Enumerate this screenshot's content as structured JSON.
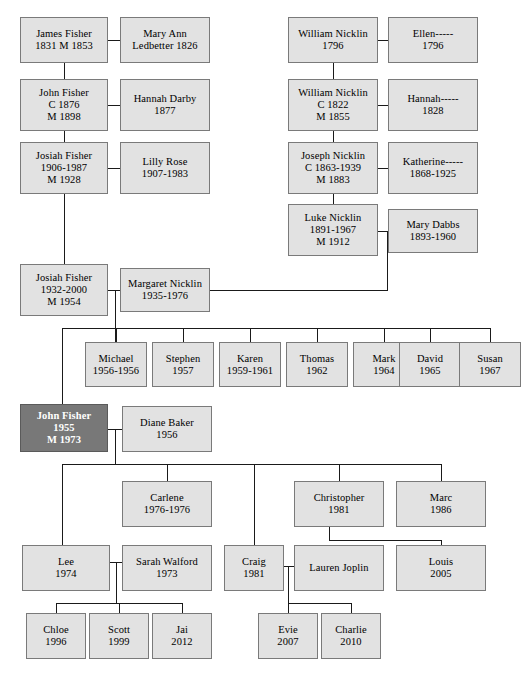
{
  "diagram": {
    "type": "genealogy-family-tree",
    "box_fill": "#e2e2e2",
    "box_border": "#7a7a7a",
    "highlight_fill": "#787878",
    "highlight_text": "#ffffff",
    "line_color": "#1a1a1a",
    "background": "#ffffff"
  },
  "nodes": [
    {
      "id": "james_fisher",
      "lines": [
        "James Fisher",
        "1831 M 1853"
      ],
      "x": 20,
      "y": 17,
      "w": 88,
      "h": 46,
      "highlight": false
    },
    {
      "id": "mary_ann",
      "lines": [
        "Mary Ann",
        "Ledbetter 1826"
      ],
      "x": 120,
      "y": 17,
      "w": 90,
      "h": 46,
      "highlight": false
    },
    {
      "id": "william_nicklin1",
      "lines": [
        "William Nicklin",
        "1796"
      ],
      "x": 288,
      "y": 17,
      "w": 90,
      "h": 46,
      "highlight": false
    },
    {
      "id": "ellen",
      "lines": [
        "Ellen-----",
        "1796"
      ],
      "x": 388,
      "y": 17,
      "w": 90,
      "h": 46,
      "highlight": false
    },
    {
      "id": "john_fisher1",
      "lines": [
        "John Fisher",
        "C 1876",
        "M 1898"
      ],
      "x": 20,
      "y": 79,
      "w": 88,
      "h": 52,
      "highlight": false
    },
    {
      "id": "hannah_darby",
      "lines": [
        "Hannah Darby",
        "1877"
      ],
      "x": 120,
      "y": 79,
      "w": 90,
      "h": 52,
      "highlight": false
    },
    {
      "id": "william_nicklin2",
      "lines": [
        "William Nicklin",
        "C 1822",
        "M 1855"
      ],
      "x": 288,
      "y": 79,
      "w": 90,
      "h": 52,
      "highlight": false
    },
    {
      "id": "hannah",
      "lines": [
        "Hannah-----",
        "1828"
      ],
      "x": 388,
      "y": 79,
      "w": 90,
      "h": 52,
      "highlight": false
    },
    {
      "id": "josiah_fisher1",
      "lines": [
        "Josiah Fisher",
        "1906-1987",
        "M 1928"
      ],
      "x": 20,
      "y": 142,
      "w": 88,
      "h": 52,
      "highlight": false
    },
    {
      "id": "lilly_rose",
      "lines": [
        "Lilly Rose",
        "1907-1983"
      ],
      "x": 120,
      "y": 142,
      "w": 90,
      "h": 52,
      "highlight": false
    },
    {
      "id": "joseph_nicklin",
      "lines": [
        "Joseph Nicklin",
        "C 1863-1939",
        "M 1883"
      ],
      "x": 288,
      "y": 142,
      "w": 90,
      "h": 52,
      "highlight": false
    },
    {
      "id": "katherine",
      "lines": [
        "Katherine-----",
        "1868-1925"
      ],
      "x": 388,
      "y": 142,
      "w": 90,
      "h": 52,
      "highlight": false
    },
    {
      "id": "luke_nicklin",
      "lines": [
        "Luke Nicklin",
        "1891-1967",
        "M 1912"
      ],
      "x": 288,
      "y": 204,
      "w": 90,
      "h": 52,
      "highlight": false
    },
    {
      "id": "mary_dabbs",
      "lines": [
        "Mary Dabbs",
        "1893-1960"
      ],
      "x": 388,
      "y": 209,
      "w": 90,
      "h": 44,
      "highlight": false
    },
    {
      "id": "josiah_fisher2",
      "lines": [
        "Josiah Fisher",
        "1932-2000",
        "M 1954"
      ],
      "x": 20,
      "y": 264,
      "w": 88,
      "h": 52,
      "highlight": false
    },
    {
      "id": "margaret_nicklin",
      "lines": [
        "Margaret Nicklin",
        "1935-1976"
      ],
      "x": 120,
      "y": 268,
      "w": 90,
      "h": 44,
      "highlight": false
    },
    {
      "id": "michael",
      "lines": [
        "Michael",
        "1956-1956"
      ],
      "x": 85,
      "y": 342,
      "w": 62,
      "h": 45,
      "highlight": false
    },
    {
      "id": "stephen",
      "lines": [
        "Stephen",
        "1957"
      ],
      "x": 152,
      "y": 342,
      "w": 62,
      "h": 45,
      "highlight": false
    },
    {
      "id": "karen",
      "lines": [
        "Karen",
        "1959-1961"
      ],
      "x": 219,
      "y": 342,
      "w": 62,
      "h": 45,
      "highlight": false
    },
    {
      "id": "thomas",
      "lines": [
        "Thomas",
        "1962"
      ],
      "x": 286,
      "y": 342,
      "w": 62,
      "h": 45,
      "highlight": false
    },
    {
      "id": "mark",
      "lines": [
        "Mark",
        "1964"
      ],
      "x": 353,
      "y": 342,
      "w": 62,
      "h": 45,
      "highlight": false
    },
    {
      "id": "david",
      "lines": [
        "David",
        "1965"
      ],
      "x": 399,
      "y": 342,
      "w": 62,
      "h": 45,
      "highlight": false
    },
    {
      "id": "susan",
      "lines": [
        "Susan",
        "1967"
      ],
      "x": 459,
      "y": 342,
      "w": 62,
      "h": 45,
      "highlight": false
    },
    {
      "id": "john_fisher2",
      "lines": [
        "John Fisher",
        "1955",
        "M 1973"
      ],
      "x": 20,
      "y": 404,
      "w": 88,
      "h": 48,
      "highlight": true
    },
    {
      "id": "diane_baker",
      "lines": [
        "Diane Baker",
        "1956"
      ],
      "x": 122,
      "y": 406,
      "w": 90,
      "h": 46,
      "highlight": false
    },
    {
      "id": "carlene",
      "lines": [
        "Carlene",
        "1976-1976"
      ],
      "x": 122,
      "y": 481,
      "w": 90,
      "h": 46,
      "highlight": false
    },
    {
      "id": "christopher",
      "lines": [
        "Christopher",
        "1981"
      ],
      "x": 294,
      "y": 481,
      "w": 90,
      "h": 46,
      "highlight": false
    },
    {
      "id": "marc",
      "lines": [
        "Marc",
        "1986"
      ],
      "x": 396,
      "y": 481,
      "w": 90,
      "h": 46,
      "highlight": false
    },
    {
      "id": "lee",
      "lines": [
        "Lee",
        "1974"
      ],
      "x": 22,
      "y": 545,
      "w": 88,
      "h": 46,
      "highlight": false
    },
    {
      "id": "sarah_walford",
      "lines": [
        "Sarah Walford",
        "1973"
      ],
      "x": 122,
      "y": 545,
      "w": 90,
      "h": 46,
      "highlight": false
    },
    {
      "id": "craig",
      "lines": [
        "Craig",
        "1981"
      ],
      "x": 224,
      "y": 545,
      "w": 60,
      "h": 46,
      "highlight": false
    },
    {
      "id": "lauren_joplin",
      "lines": [
        "Lauren Joplin"
      ],
      "x": 294,
      "y": 545,
      "w": 90,
      "h": 46,
      "highlight": false
    },
    {
      "id": "louis",
      "lines": [
        "Louis",
        "2005"
      ],
      "x": 396,
      "y": 545,
      "w": 90,
      "h": 46,
      "highlight": false
    },
    {
      "id": "chloe",
      "lines": [
        "Chloe",
        "1996"
      ],
      "x": 26,
      "y": 613,
      "w": 60,
      "h": 46,
      "highlight": false
    },
    {
      "id": "scott",
      "lines": [
        "Scott",
        "1999"
      ],
      "x": 89,
      "y": 613,
      "w": 60,
      "h": 46,
      "highlight": false
    },
    {
      "id": "jai",
      "lines": [
        "Jai",
        "2012"
      ],
      "x": 152,
      "y": 613,
      "w": 60,
      "h": 46,
      "highlight": false
    },
    {
      "id": "evie",
      "lines": [
        "Evie",
        "2007"
      ],
      "x": 258,
      "y": 613,
      "w": 60,
      "h": 46,
      "highlight": false
    },
    {
      "id": "charlie",
      "lines": [
        "Charlie",
        "2010"
      ],
      "x": 321,
      "y": 613,
      "w": 60,
      "h": 46,
      "highlight": false
    }
  ],
  "edges": [
    {
      "o": "h",
      "x": 108,
      "y": 40,
      "len": 12,
      "note": "james-maryann-marriage"
    },
    {
      "o": "v",
      "x": 64,
      "y": 63,
      "len": 16,
      "note": "james-to-john"
    },
    {
      "o": "h",
      "x": 108,
      "y": 105,
      "len": 12,
      "note": "john-hannahdarby-marriage"
    },
    {
      "o": "v",
      "x": 64,
      "y": 131,
      "len": 11,
      "note": "john-to-josiah1"
    },
    {
      "o": "h",
      "x": 108,
      "y": 168,
      "len": 12,
      "note": "josiah1-lillyrose-marriage"
    },
    {
      "o": "v",
      "x": 64,
      "y": 194,
      "len": 70,
      "note": "josiah1-to-josiah2"
    },
    {
      "o": "h",
      "x": 378,
      "y": 40,
      "len": 10,
      "note": "william1-ellen-marriage"
    },
    {
      "o": "v",
      "x": 333,
      "y": 63,
      "len": 16,
      "note": "william1-to-william2"
    },
    {
      "o": "h",
      "x": 378,
      "y": 105,
      "len": 10,
      "note": "william2-hannah-marriage"
    },
    {
      "o": "v",
      "x": 333,
      "y": 131,
      "len": 11,
      "note": "william2-to-joseph"
    },
    {
      "o": "h",
      "x": 378,
      "y": 168,
      "len": 10,
      "note": "joseph-katherine-marriage"
    },
    {
      "o": "v",
      "x": 333,
      "y": 194,
      "len": 10,
      "note": "joseph-to-luke"
    },
    {
      "o": "h",
      "x": 378,
      "y": 231,
      "len": 10,
      "note": "luke-marydabbs-marriage"
    },
    {
      "o": "v",
      "x": 387,
      "y": 231,
      "len": 59,
      "note": "luke-line-down"
    },
    {
      "o": "h",
      "x": 210,
      "y": 290,
      "len": 178,
      "note": "margaret-parent-link"
    },
    {
      "o": "h",
      "x": 108,
      "y": 290,
      "len": 12,
      "note": "josiah2-margaret-marriage"
    },
    {
      "o": "v",
      "x": 115,
      "y": 290,
      "len": 52,
      "note": "josiah2-margaret-drop"
    },
    {
      "o": "h",
      "x": 62,
      "y": 328,
      "len": 428,
      "note": "josiah2-children-bar"
    },
    {
      "o": "v",
      "x": 62,
      "y": 328,
      "len": 76,
      "note": "drop-to-johnfisher2"
    },
    {
      "o": "v",
      "x": 116,
      "y": 328,
      "len": 14,
      "note": "drop-michael"
    },
    {
      "o": "v",
      "x": 183,
      "y": 328,
      "len": 14,
      "note": "drop-stephen"
    },
    {
      "o": "v",
      "x": 250,
      "y": 328,
      "len": 14,
      "note": "drop-karen"
    },
    {
      "o": "v",
      "x": 317,
      "y": 328,
      "len": 14,
      "note": "drop-thomas"
    },
    {
      "o": "v",
      "x": 384,
      "y": 328,
      "len": 14,
      "note": "drop-mark"
    },
    {
      "o": "v",
      "x": 430,
      "y": 328,
      "len": 14,
      "note": "drop-david"
    },
    {
      "o": "v",
      "x": 490,
      "y": 328,
      "len": 14,
      "note": "drop-susan"
    },
    {
      "o": "h",
      "x": 108,
      "y": 429,
      "len": 14,
      "note": "johnfisher2-diane-marriage"
    },
    {
      "o": "v",
      "x": 115,
      "y": 429,
      "len": 35,
      "note": "johnfisher2-diane-drop"
    },
    {
      "o": "h",
      "x": 62,
      "y": 464,
      "len": 379,
      "note": "johnfisher2-children-bar"
    },
    {
      "o": "v",
      "x": 62,
      "y": 464,
      "len": 81,
      "note": "drop-to-lee"
    },
    {
      "o": "v",
      "x": 167,
      "y": 464,
      "len": 17,
      "note": "drop-carlene"
    },
    {
      "o": "v",
      "x": 254,
      "y": 464,
      "len": 81,
      "note": "drop-craig"
    },
    {
      "o": "v",
      "x": 339,
      "y": 464,
      "len": 17,
      "note": "drop-christopher"
    },
    {
      "o": "v",
      "x": 441,
      "y": 464,
      "len": 17,
      "note": "drop-marc"
    },
    {
      "o": "v",
      "x": 329,
      "y": 527,
      "len": 13,
      "note": "christopher-down"
    },
    {
      "o": "h",
      "x": 329,
      "y": 540,
      "len": 112,
      "note": "christopher-to-louis-bar"
    },
    {
      "o": "v",
      "x": 441,
      "y": 540,
      "len": 5,
      "note": "drop-louis"
    },
    {
      "o": "h",
      "x": 110,
      "y": 562,
      "len": 12,
      "note": "lee-sarah-marriage"
    },
    {
      "o": "v",
      "x": 116,
      "y": 562,
      "len": 41,
      "note": "lee-sarah-drop"
    },
    {
      "o": "h",
      "x": 56,
      "y": 603,
      "len": 126,
      "note": "lee-children-bar"
    },
    {
      "o": "v",
      "x": 56,
      "y": 603,
      "len": 10,
      "note": "drop-chloe"
    },
    {
      "o": "v",
      "x": 119,
      "y": 603,
      "len": 10,
      "note": "drop-scott"
    },
    {
      "o": "v",
      "x": 182,
      "y": 603,
      "len": 10,
      "note": "drop-jai"
    },
    {
      "o": "h",
      "x": 284,
      "y": 566,
      "len": 10,
      "note": "craig-lauren-marriage"
    },
    {
      "o": "v",
      "x": 288,
      "y": 566,
      "len": 37,
      "note": "craig-lauren-drop"
    },
    {
      "o": "h",
      "x": 288,
      "y": 603,
      "len": 63,
      "note": "craig-children-bar"
    },
    {
      "o": "v",
      "x": 288,
      "y": 603,
      "len": 10,
      "note": "drop-evie"
    },
    {
      "o": "v",
      "x": 351,
      "y": 603,
      "len": 10,
      "note": "drop-charlie"
    }
  ]
}
